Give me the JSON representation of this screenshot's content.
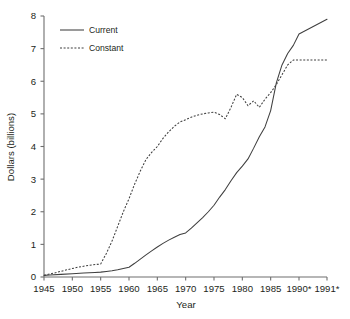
{
  "chart_data": {
    "type": "line",
    "title": "",
    "xlabel": "Year",
    "ylabel": "Dollars (billions)",
    "xlim": [
      1945,
      1991
    ],
    "ylim": [
      0,
      8
    ],
    "grid": false,
    "legend_position": "upper-left-inside",
    "x_tick_labels": [
      "1945",
      "1950",
      "1955",
      "1960",
      "1965",
      "1970",
      "1975",
      "1980",
      "1985",
      "1990*",
      "1991*"
    ],
    "x_tick_values": [
      1945,
      1950,
      1955,
      1960,
      1965,
      1970,
      1975,
      1980,
      1985,
      1990,
      1991
    ],
    "y_tick_labels": [
      "0",
      "1",
      "2",
      "3",
      "4",
      "5",
      "6",
      "7",
      "8"
    ],
    "y_tick_values": [
      0,
      1,
      2,
      3,
      4,
      5,
      6,
      7,
      8
    ],
    "series": [
      {
        "name": "Current",
        "style": "solid",
        "color": "#3f3f3f",
        "x": [
          1945,
          1946,
          1948,
          1950,
          1952,
          1954,
          1955,
          1956,
          1957,
          1958,
          1959,
          1960,
          1961,
          1962,
          1963,
          1964,
          1965,
          1966,
          1967,
          1968,
          1969,
          1970,
          1971,
          1972,
          1973,
          1974,
          1975,
          1976,
          1977,
          1978,
          1979,
          1980,
          1981,
          1982,
          1983,
          1984,
          1985,
          1986,
          1987,
          1988,
          1989,
          1990,
          1991
        ],
        "values": [
          0.05,
          0.06,
          0.08,
          0.1,
          0.12,
          0.14,
          0.15,
          0.17,
          0.19,
          0.22,
          0.26,
          0.3,
          0.42,
          0.55,
          0.68,
          0.8,
          0.92,
          1.03,
          1.13,
          1.22,
          1.3,
          1.35,
          1.5,
          1.66,
          1.82,
          2.0,
          2.2,
          2.45,
          2.68,
          2.95,
          3.2,
          3.4,
          3.62,
          3.95,
          4.3,
          4.6,
          5.1,
          5.95,
          6.5,
          6.85,
          7.1,
          7.45,
          7.9
        ]
      },
      {
        "name": "Constant",
        "style": "dashed",
        "color": "#3f3f3f",
        "x": [
          1945,
          1947,
          1949,
          1951,
          1953,
          1955,
          1956,
          1957,
          1958,
          1959,
          1960,
          1961,
          1962,
          1963,
          1964,
          1965,
          1966,
          1967,
          1968,
          1969,
          1970,
          1971,
          1972,
          1973,
          1974,
          1975,
          1976,
          1977,
          1978,
          1979,
          1980,
          1981,
          1982,
          1983,
          1984,
          1985,
          1986,
          1987,
          1988,
          1989,
          1990,
          1991
        ],
        "values": [
          0.05,
          0.13,
          0.22,
          0.3,
          0.36,
          0.4,
          0.72,
          1.1,
          1.55,
          2.0,
          2.4,
          2.85,
          3.25,
          3.6,
          3.82,
          4.0,
          4.25,
          4.45,
          4.62,
          4.75,
          4.82,
          4.9,
          4.96,
          5.0,
          5.03,
          5.05,
          4.98,
          4.85,
          5.2,
          5.6,
          5.5,
          5.25,
          5.4,
          5.2,
          5.45,
          5.65,
          5.9,
          6.2,
          6.5,
          6.65,
          6.65,
          6.65
        ]
      }
    ]
  },
  "legend": {
    "entries": [
      {
        "label": "Current"
      },
      {
        "label": "Constant"
      }
    ]
  }
}
